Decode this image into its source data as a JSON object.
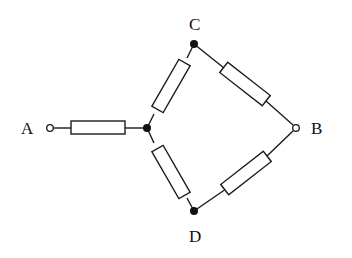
{
  "diagram": {
    "type": "circuit",
    "labels": {
      "A": "A",
      "B": "B",
      "C": "C",
      "D": "D"
    },
    "terminals": [
      {
        "id": "A",
        "kind": "open-terminal"
      },
      {
        "id": "B",
        "kind": "open-terminal"
      }
    ],
    "nodes": [
      {
        "id": "junction",
        "kind": "filled-node"
      },
      {
        "id": "C",
        "kind": "filled-node"
      },
      {
        "id": "D",
        "kind": "filled-node"
      }
    ],
    "resistors": [
      {
        "id": "R-A-junction",
        "from": "A",
        "to": "junction"
      },
      {
        "id": "R-junction-C",
        "from": "junction",
        "to": "C"
      },
      {
        "id": "R-junction-D",
        "from": "junction",
        "to": "D"
      },
      {
        "id": "R-C-B",
        "from": "C",
        "to": "B"
      },
      {
        "id": "R-D-B",
        "from": "D",
        "to": "B"
      }
    ]
  }
}
